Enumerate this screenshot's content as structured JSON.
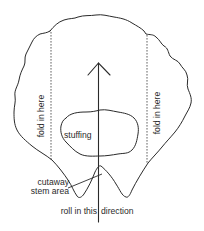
{
  "diagram": {
    "colors": {
      "line": "#2a2a2a",
      "background": "#ffffff"
    },
    "labels": {
      "fold_left": "fold in here",
      "fold_right": "fold in here",
      "stuffing": "stuffing",
      "cutaway_line1": "cutaway",
      "cutaway_line2": "stem area",
      "roll_left": "roll in this",
      "roll_right": "direction"
    },
    "elements": [
      {
        "name": "leaf-outline",
        "type": "irregular closed outline with two bottom lobes"
      },
      {
        "name": "fold-line-left",
        "type": "dashed vertical line"
      },
      {
        "name": "fold-line-right",
        "type": "dashed vertical line"
      },
      {
        "name": "stuffing-blob",
        "type": "irregular closed shape"
      },
      {
        "name": "roll-direction-arrow",
        "type": "vertical arrow pointing up"
      },
      {
        "name": "cutaway-leader-line",
        "type": "leader line to stem notch"
      }
    ]
  }
}
